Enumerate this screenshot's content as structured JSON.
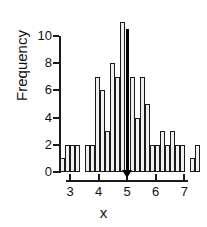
{
  "chart_data": {
    "type": "bar",
    "title": "",
    "subtitle": "",
    "xlabel": "x",
    "ylabel": "Frequency",
    "xlim": [
      2.65,
      7.55
    ],
    "ylim": [
      0,
      11.5
    ],
    "grid": false,
    "legend": null,
    "bin_width": 0.175,
    "x_ticks": [
      3,
      4,
      5,
      6,
      7
    ],
    "x_tick_labels": [
      "3",
      "4",
      "5",
      "6",
      "7"
    ],
    "y_ticks": [
      0,
      2,
      4,
      6,
      8,
      10
    ],
    "y_tick_labels": [
      "0",
      "2",
      "4",
      "6",
      "8",
      "10"
    ],
    "bar_fill_color": "#efefef",
    "bar_edge_color": "#1a1a1a",
    "highlight_color": "#000000",
    "highlight_bin_center": 5.0,
    "highlight_marker": "triangle-up",
    "bins": [
      {
        "center": 2.74,
        "value": 1,
        "highlight": false
      },
      {
        "center": 2.91,
        "value": 2,
        "highlight": false
      },
      {
        "center": 3.09,
        "value": 2,
        "highlight": false
      },
      {
        "center": 3.26,
        "value": 2,
        "highlight": false
      },
      {
        "center": 3.44,
        "value": 0,
        "highlight": false
      },
      {
        "center": 3.61,
        "value": 2,
        "highlight": false
      },
      {
        "center": 3.79,
        "value": 2,
        "highlight": false
      },
      {
        "center": 3.96,
        "value": 7,
        "highlight": false
      },
      {
        "center": 4.14,
        "value": 6,
        "highlight": false
      },
      {
        "center": 4.31,
        "value": 3,
        "highlight": false
      },
      {
        "center": 4.49,
        "value": 8,
        "highlight": false
      },
      {
        "center": 4.66,
        "value": 7,
        "highlight": false
      },
      {
        "center": 4.84,
        "value": 11,
        "highlight": false
      },
      {
        "center": 5.01,
        "value": 10,
        "highlight": true
      },
      {
        "center": 5.19,
        "value": 7,
        "highlight": false
      },
      {
        "center": 5.36,
        "value": 4,
        "highlight": false
      },
      {
        "center": 5.54,
        "value": 7,
        "highlight": false
      },
      {
        "center": 5.71,
        "value": 5,
        "highlight": false
      },
      {
        "center": 5.89,
        "value": 2,
        "highlight": false
      },
      {
        "center": 6.06,
        "value": 2,
        "highlight": false
      },
      {
        "center": 6.24,
        "value": 3,
        "highlight": false
      },
      {
        "center": 6.41,
        "value": 2,
        "highlight": false
      },
      {
        "center": 6.59,
        "value": 3,
        "highlight": false
      },
      {
        "center": 6.76,
        "value": 2,
        "highlight": false
      },
      {
        "center": 6.94,
        "value": 2,
        "highlight": false
      },
      {
        "center": 7.11,
        "value": 0,
        "highlight": false
      },
      {
        "center": 7.29,
        "value": 1,
        "highlight": false
      },
      {
        "center": 7.46,
        "value": 2,
        "highlight": false
      }
    ]
  }
}
